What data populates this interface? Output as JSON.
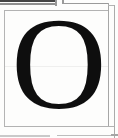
{
  "specimen": {
    "glyph": "O"
  },
  "colors": {
    "background": "#fdfdfc",
    "glyph": "#0e0e0e",
    "cell_border": "#b2b2b2",
    "dark_rule": "#454545",
    "gray_rule": "#8f8f8f",
    "faint_rule": "#c9c9c9"
  }
}
